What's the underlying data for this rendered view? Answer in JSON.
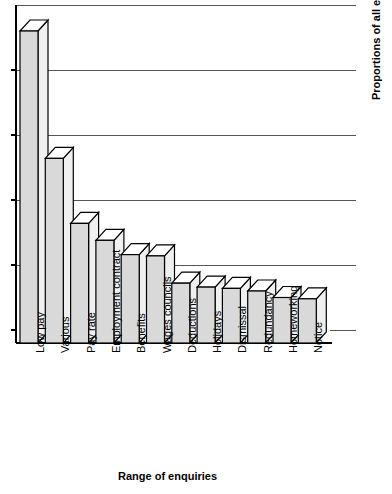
{
  "chart_data": {
    "type": "bar",
    "title": "",
    "subtitle": "",
    "xlabel": "Range of enquiries",
    "ylabel": "Proportions of all enquiries",
    "categories": [
      "Low pay",
      "Various",
      "Pay rate",
      "Employment contract",
      "Benefits",
      "Wages councils",
      "Deductions",
      "Holidays",
      "Dismissal",
      "Redundancy",
      "Homeworking",
      "Notice"
    ],
    "values": [
      24.0,
      14.2,
      9.2,
      7.9,
      6.8,
      6.7,
      4.6,
      4.3,
      4.2,
      4.0,
      3.5,
      3.4
    ],
    "ylim": [
      0,
      26
    ],
    "ytick_values": [
      0,
      5.2,
      10.4,
      15.6,
      20.8,
      26.0
    ],
    "ytick_labels": [
      "",
      "",
      "",
      "",
      "",
      ""
    ],
    "gridlines": true,
    "gridline_count": 5,
    "legend": null,
    "legend_position": "none",
    "style": "3d-bars",
    "bar_fill_color": "#d9d9d9",
    "bar_top_color": "#ffffff",
    "bar_side_color": "#f0f0f0",
    "bar_outline_color": "#000000",
    "grid_color": "#555555",
    "axis_color": "#000000",
    "background_color": "#ffffff",
    "annotations": []
  },
  "axes": {
    "x_title": "Range of enquiries",
    "y_title": "Proportions of all enquiries"
  }
}
